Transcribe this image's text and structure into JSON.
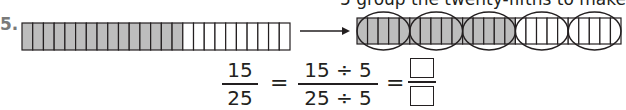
{
  "problem": {
    "number": "5.",
    "hint_text": "5 group the twenty-fifths to make",
    "left_bar": {
      "total_parts": 25,
      "shaded_parts": 15
    },
    "right_bar": {
      "total_parts": 25,
      "shaded_parts": 15,
      "group_size": 5,
      "groups": 5
    },
    "colors": {
      "shaded": "#bdbdbd",
      "line": "#231f20"
    },
    "equation": {
      "frac1": {
        "numerator": "15",
        "denominator": "25"
      },
      "equals": "=",
      "frac2": {
        "numerator": "15 ÷ 5",
        "denominator": "25 ÷ 5"
      },
      "answer": {
        "numerator": "",
        "denominator": ""
      }
    }
  }
}
